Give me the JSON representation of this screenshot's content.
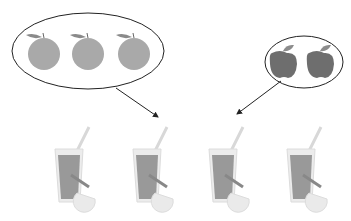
{
  "diagram": {
    "groups": [
      {
        "name": "oranges",
        "count": 3,
        "color": "#a8a8a8"
      },
      {
        "name": "apples",
        "count": 2,
        "color": "#6e6e6e"
      }
    ],
    "result": {
      "name": "juice-glasses",
      "count": 4,
      "juice_color": "#9a9a9a"
    },
    "outline_color": "#222222"
  }
}
